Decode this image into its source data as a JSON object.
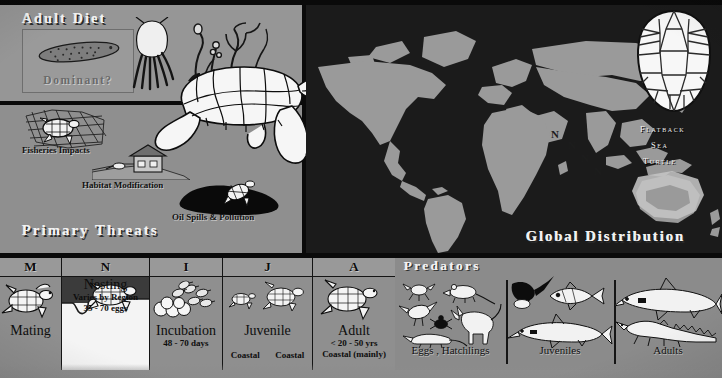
{
  "poster": {
    "subject": "Flatback Sea Turtle",
    "width": 722,
    "height": 378
  },
  "colors": {
    "panel_gray": "#8f8f8f",
    "diet_panel_gray": "#969696",
    "map_ocean": "#1b1b1b",
    "map_land": "#9a9a9a",
    "range_highlight": "#bdbdbd",
    "frame_black": "#0a0a0a",
    "title_text": "#f2f2f2",
    "body_text": "#0d0d0d"
  },
  "adult_diet": {
    "title": "Adult Diet",
    "dominant_box": {
      "label": "Dominant?",
      "icon": "sea-cucumber-icon"
    },
    "prey_icons": [
      "squid-icon",
      "soft-coral-icon",
      "sea-pen-icon"
    ]
  },
  "primary_threats": {
    "title": "Primary Threats",
    "items": [
      {
        "label": "Fisheries Impacts",
        "icon": "turtle-in-net-icon"
      },
      {
        "label": "Habitat Modification",
        "icon": "coastal-house-icon"
      },
      {
        "label": "Oil Spills & Pollution",
        "icon": "oil-slick-icon"
      }
    ]
  },
  "turtle_illustration": {
    "icon": "sea-turtle-side-view-icon"
  },
  "global_distribution": {
    "title": "Global Distribution",
    "species_label_lines": [
      "Flatback",
      "Sea",
      "Turtle"
    ],
    "carapace_inset_icon": "turtle-carapace-top-view-icon",
    "nesting_markers": [
      "N",
      "N",
      "N",
      "N"
    ],
    "nesting_marker_meaning": "N"
  },
  "life_cycle": {
    "stages": [
      {
        "code": "M",
        "name": "Mating",
        "sub": [],
        "habitat": [],
        "icon": "turtle-mating-icon"
      },
      {
        "code": "N",
        "name": "Nesting",
        "sub": [
          "Varies by Region",
          "35 - 70 eggs"
        ],
        "habitat": [],
        "icon": "turtle-nesting-beach-icon"
      },
      {
        "code": "I",
        "name": "Incubation",
        "sub": [
          "48 - 70 days"
        ],
        "habitat": [],
        "icon": "eggs-hatchlings-icon"
      },
      {
        "code": "J",
        "name": "Juvenile",
        "sub": [],
        "habitat": [
          "Coastal",
          "Coastal"
        ],
        "icon": "juvenile-turtles-icon"
      },
      {
        "code": "A",
        "name": "Adult",
        "sub": [
          "< 20 - 50 yrs",
          "Coastal (mainly)"
        ],
        "habitat": [],
        "icon": "adult-turtle-icon"
      }
    ]
  },
  "predators": {
    "title": "Predators",
    "groups": [
      {
        "label": "Eggs , Hatchlings",
        "icons": [
          "crab-icon",
          "rat-icon",
          "bird-icon",
          "beetle-icon",
          "dingo-icon",
          "monitor-lizard-icon"
        ]
      },
      {
        "label": "Juveniles",
        "icons": [
          "frigatebird-icon",
          "trevally-fish-icon",
          "shark-icon"
        ]
      },
      {
        "label": "Adults",
        "icons": [
          "shark-icon",
          "saltwater-crocodile-icon"
        ]
      }
    ]
  }
}
